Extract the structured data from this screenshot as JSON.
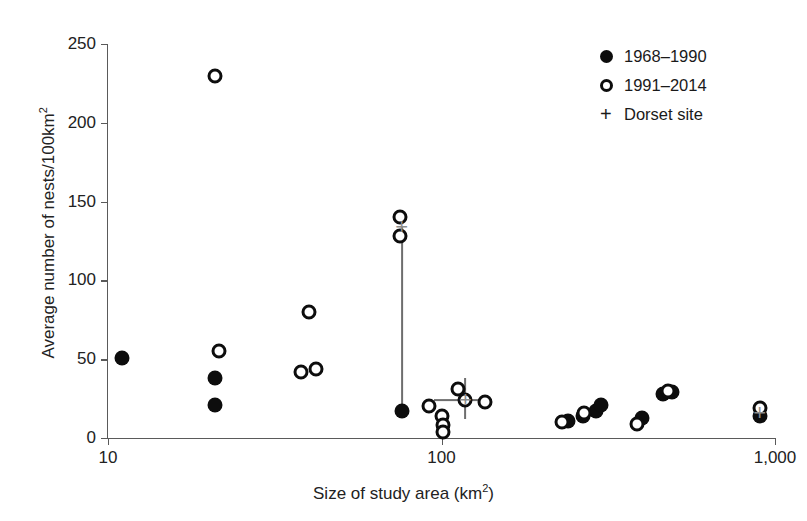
{
  "chart_data": {
    "type": "scatter",
    "title": "",
    "xlabel": "Size of study area (km²)",
    "ylabel": "Average number of nests/100km²",
    "xscale": "log",
    "yscale": "linear",
    "xlim": [
      10,
      1000
    ],
    "ylim": [
      0,
      250
    ],
    "xticks": [
      10,
      100,
      1000
    ],
    "xticklabels": [
      "10",
      "100",
      "1,000"
    ],
    "yticks": [
      0,
      50,
      100,
      150,
      200,
      250
    ],
    "yticklabels": [
      "0",
      "50",
      "100",
      "150",
      "200",
      "250"
    ],
    "grid": false,
    "legend_position": "top-right",
    "series": [
      {
        "name": "1968–1990",
        "marker": "filled-circle",
        "color": "#0d0d0d",
        "points": [
          {
            "x": 11.0,
            "y": 51
          },
          {
            "x": 21.0,
            "y": 38
          },
          {
            "x": 21.0,
            "y": 21
          },
          {
            "x": 76.0,
            "y": 17
          },
          {
            "x": 240.0,
            "y": 11
          },
          {
            "x": 265.0,
            "y": 14
          },
          {
            "x": 290.0,
            "y": 17
          },
          {
            "x": 300.0,
            "y": 21
          },
          {
            "x": 400.0,
            "y": 13
          },
          {
            "x": 460.0,
            "y": 28
          },
          {
            "x": 490.0,
            "y": 29
          },
          {
            "x": 900.0,
            "y": 14
          }
        ]
      },
      {
        "name": "1991–2014",
        "marker": "open-circle",
        "color": "#0d0d0d",
        "points": [
          {
            "x": 21.0,
            "y": 230
          },
          {
            "x": 21.5,
            "y": 55
          },
          {
            "x": 40.0,
            "y": 80
          },
          {
            "x": 38.0,
            "y": 42
          },
          {
            "x": 42.0,
            "y": 44
          },
          {
            "x": 75.0,
            "y": 140
          },
          {
            "x": 75.0,
            "y": 128
          },
          {
            "x": 92.0,
            "y": 20
          },
          {
            "x": 100.0,
            "y": 14
          },
          {
            "x": 101.0,
            "y": 8
          },
          {
            "x": 101.0,
            "y": 4
          },
          {
            "x": 112.0,
            "y": 31
          },
          {
            "x": 118.0,
            "y": 24
          },
          {
            "x": 135.0,
            "y": 23
          },
          {
            "x": 230.0,
            "y": 10
          },
          {
            "x": 268.0,
            "y": 16
          },
          {
            "x": 385.0,
            "y": 9
          },
          {
            "x": 478.0,
            "y": 30
          },
          {
            "x": 900.0,
            "y": 19
          }
        ]
      },
      {
        "name": "Dorset site",
        "marker": "plus",
        "color": "#8d8d8d",
        "points": [
          {
            "x": 76.0,
            "y": 134,
            "yerr_low": 17,
            "yerr_high": 134
          },
          {
            "x": 118.0,
            "y": 24,
            "yerr_low": 12,
            "yerr_high": 38,
            "xerr_low": 95,
            "xerr_high": 142
          },
          {
            "x": 900.0,
            "y": 16,
            "yerr_low": 13,
            "yerr_high": 20
          }
        ]
      }
    ],
    "legend": [
      {
        "label": "1968–1990",
        "symbol": "filled-circle"
      },
      {
        "label": "1991–2014",
        "symbol": "open-circle"
      },
      {
        "label": "Dorset site",
        "symbol": "plus"
      }
    ]
  },
  "axes": {
    "ylabel_main": "Average number of nests/100km",
    "ylabel_sup": "2",
    "xlabel_main": "Size of study area (km",
    "xlabel_sup": "2",
    "xlabel_tail": ")"
  }
}
